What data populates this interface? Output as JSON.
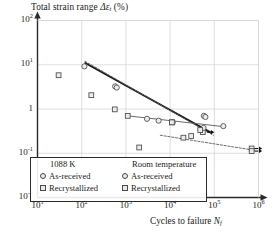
{
  "chart_data": {
    "type": "scatter",
    "title": "",
    "ylabel": "Total strain range Δεt (%)",
    "ylabel_parts": {
      "prefix": "Total strain range ",
      "delta": "Δ",
      "eps": "ε",
      "sub": "t",
      "unit": " (%)"
    },
    "xlabel": "Cycles to failure Nf",
    "xlabel_parts": {
      "prefix": "Cycles to failure ",
      "sym": "N",
      "sub": "f"
    },
    "xscale": "log",
    "yscale": "log",
    "xlim": [
      10,
      1000000
    ],
    "ylim": [
      0.01,
      100
    ],
    "grid": true,
    "xticks": [
      {
        "value": 10,
        "mantissa": "10",
        "exp": "1"
      },
      {
        "value": 100,
        "mantissa": "10",
        "exp": "2"
      },
      {
        "value": 1000,
        "mantissa": "10",
        "exp": "3"
      },
      {
        "value": 10000,
        "mantissa": "10",
        "exp": "4"
      },
      {
        "value": 100000,
        "mantissa": "10",
        "exp": "5"
      },
      {
        "value": 1000000,
        "mantissa": "10",
        "exp": "6"
      }
    ],
    "yticks": [
      {
        "value": 100,
        "mantissa": "10",
        "exp": "2"
      },
      {
        "value": 10,
        "mantissa": "10",
        "exp": "1"
      },
      {
        "value": 1,
        "mantissa": "1",
        "exp": ""
      },
      {
        "value": 0.1,
        "mantissa": "10",
        "exp": "-1"
      },
      {
        "value": 0.01,
        "mantissa": "10",
        "exp": "-2"
      }
    ],
    "series": [
      {
        "name": "1088 K As-received",
        "marker": "circle",
        "points": [
          {
            "x": 115,
            "y": 9.2
          },
          {
            "x": 570,
            "y": 3.25
          },
          {
            "x": 620,
            "y": 3.05
          },
          {
            "x": 58000,
            "y": 0.7
          },
          {
            "x": 63000,
            "y": 0.66
          }
        ]
      },
      {
        "name": "1088 K Recrystallized",
        "marker": "square",
        "points": [
          {
            "x": 30,
            "y": 5.8
          },
          {
            "x": 165,
            "y": 2.05
          },
          {
            "x": 560,
            "y": 0.98
          },
          {
            "x": 2000,
            "y": 0.135
          },
          {
            "x": 11000,
            "y": 0.5
          },
          {
            "x": 20000,
            "y": 0.225
          },
          {
            "x": 30000,
            "y": 0.245
          },
          {
            "x": 55000,
            "y": 0.3
          }
        ]
      },
      {
        "name": "Room temperature As-received",
        "marker": "circle",
        "points": [
          {
            "x": 3000,
            "y": 0.6
          },
          {
            "x": 5500,
            "y": 0.545
          },
          {
            "x": 11500,
            "y": 0.5
          },
          {
            "x": 57000,
            "y": 0.375
          },
          {
            "x": 160000,
            "y": 0.41
          }
        ]
      },
      {
        "name": "Room temperature Recrystallized",
        "marker": "square",
        "points": [
          {
            "x": 1100,
            "y": 0.7
          },
          {
            "x": 11000,
            "y": 0.5
          },
          {
            "x": 48000,
            "y": 0.335
          },
          {
            "x": 700000,
            "y": 0.128,
            "runout": true
          },
          {
            "x": 700000,
            "y": 0.112,
            "runout": true
          }
        ]
      }
    ],
    "fit_lines": [
      {
        "name": "1088K-solid",
        "style": "solid",
        "weight": 1.8,
        "points": [
          {
            "x": 120,
            "y": 11.0
          },
          {
            "x": 80000,
            "y": 0.3
          }
        ]
      },
      {
        "name": "1088K-dashed",
        "style": "dashed",
        "weight": 1.0,
        "points": [
          {
            "x": 118,
            "y": 12.0
          },
          {
            "x": 95000,
            "y": 0.255
          }
        ]
      },
      {
        "name": "RT-asreceived-solid",
        "style": "solid",
        "weight": 0.9,
        "points": [
          {
            "x": 1100,
            "y": 0.7
          },
          {
            "x": 180000,
            "y": 0.395
          }
        ]
      },
      {
        "name": "RT-recrystallized-dashed",
        "style": "dashed",
        "weight": 0.9,
        "points": [
          {
            "x": 6000,
            "y": 0.255
          },
          {
            "x": 760000,
            "y": 0.118
          }
        ]
      }
    ],
    "annotations": [
      {
        "name": "runout-arrow-mid",
        "x": 58000,
        "y": 0.3,
        "direction": "right"
      },
      {
        "name": "runout-arrow-top-right",
        "x": 700000,
        "y": 0.128,
        "direction": "right"
      },
      {
        "name": "runout-arrow-bottom-right",
        "x": 700000,
        "y": 0.112,
        "direction": "right"
      }
    ],
    "legend": {
      "position": "bottom-left-inside",
      "columns": [
        {
          "heading": "1088 K",
          "entries": [
            {
              "label": "As-received",
              "marker": "circle"
            },
            {
              "label": "Recrystallized",
              "marker": "square"
            }
          ]
        },
        {
          "heading": "Room temperature",
          "entries": [
            {
              "label": "As-received",
              "marker": "circle"
            },
            {
              "label": "Recrystallized",
              "marker": "square"
            }
          ]
        }
      ]
    },
    "colors": {
      "axis": "#2b2b2b",
      "grid": "#d7d7d7",
      "marker_edge": "#4a4a4a",
      "marker_fill": "#ececec",
      "line_dark": "#1a1a1a",
      "line_light": "#5a5a5a",
      "background": "#ffffff"
    }
  }
}
